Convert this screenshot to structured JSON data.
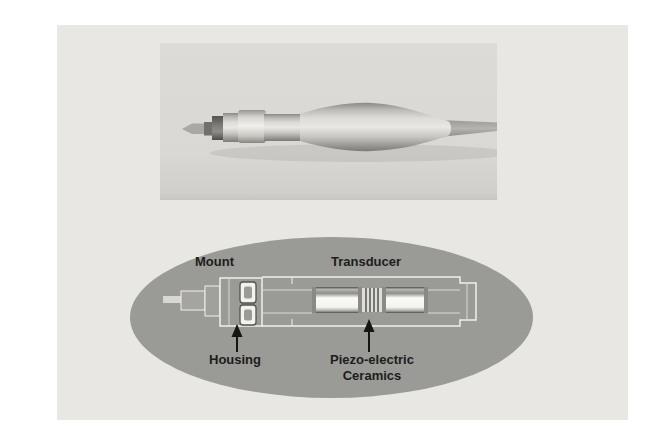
{
  "figure": {
    "diagram": {
      "labels": {
        "mount": "Mount",
        "transducer": "Transducer",
        "housing": "Housing",
        "piezo_line1": "Piezo-electric",
        "piezo_line2": "Ceramics"
      }
    },
    "colors": {
      "page_background": "#ffffff",
      "content_background": "#e8e7e4",
      "photo_background": "#d9d8d4",
      "ellipse_background": "#9a9a97",
      "diagram_outline": "#efefeb",
      "label_text": "#1d1d1b",
      "arrow_color": "#151513"
    }
  }
}
